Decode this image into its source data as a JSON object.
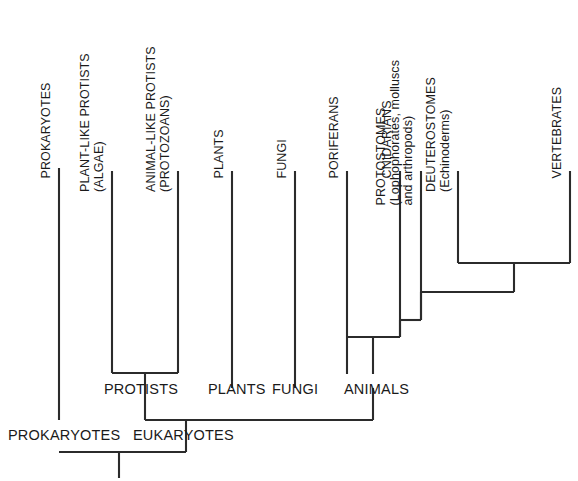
{
  "figure": {
    "kind": "cladogram",
    "background_color": "#ffffff",
    "line_color": "#2b2b2b",
    "text_color": "#1a1a1a"
  },
  "tip_labels": [
    {
      "id": "prokaryotes",
      "lines": [
        "PROKARYOTES"
      ]
    },
    {
      "id": "plant-like-protists",
      "lines": [
        "PLANT-LIKE PROTISTS",
        "(ALGAE)"
      ]
    },
    {
      "id": "animal-like-protists",
      "lines": [
        "ANIMAL-LIKE PROTISTS",
        "(PROTOZOANS)"
      ]
    },
    {
      "id": "plants",
      "lines": [
        "PLANTS"
      ]
    },
    {
      "id": "fungi",
      "lines": [
        "FUNGI"
      ]
    },
    {
      "id": "poriferans",
      "lines": [
        "PORIFERANS"
      ]
    },
    {
      "id": "cnidarians",
      "lines": [
        "CNIDARIANS"
      ]
    },
    {
      "id": "protostomes",
      "lines": [
        "PROTOSTOMES",
        "(Lophophorates, molluscs",
        "and arthropods)"
      ]
    },
    {
      "id": "deuterostomes",
      "lines": [
        "DEUTEROSTOMES",
        "(Echinoderms)"
      ]
    },
    {
      "id": "vertebrates",
      "lines": [
        "VERTEBRATES"
      ]
    }
  ],
  "node_labels": [
    {
      "id": "protists",
      "text": "PROTISTS"
    },
    {
      "id": "plants-node",
      "text": "PLANTS"
    },
    {
      "id": "fungi-node",
      "text": "FUNGI"
    },
    {
      "id": "animals",
      "text": "ANIMALS"
    },
    {
      "id": "prokaryotes-node",
      "text": "PROKARYOTES"
    },
    {
      "id": "eukaryotes",
      "text": "EUKARYOTES"
    }
  ]
}
